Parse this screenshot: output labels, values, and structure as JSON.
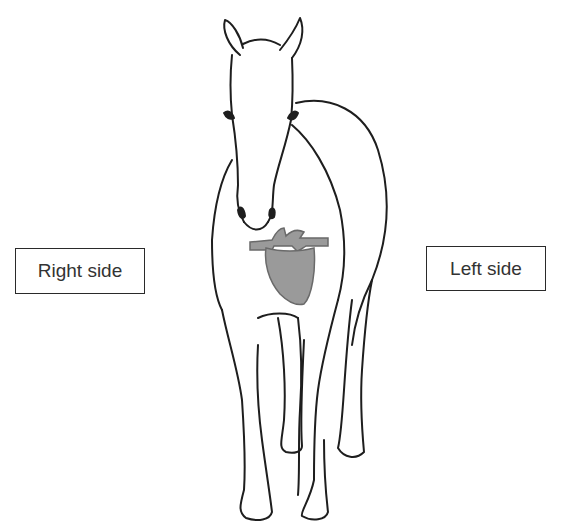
{
  "diagram": {
    "highlighted_organ": "heart",
    "labels": {
      "right": "Right side",
      "left": "Left side"
    },
    "colors": {
      "outline": "#1e1e1e",
      "heart_fill": "#9a9a9a",
      "heart_stroke": "#6a6a6a",
      "background": "#ffffff"
    }
  }
}
